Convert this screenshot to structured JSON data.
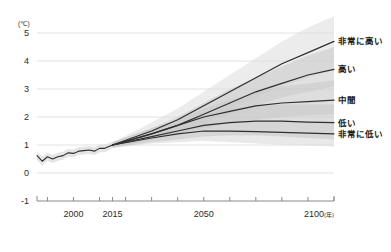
{
  "chart_data": {
    "type": "line",
    "title": "",
    "subtitle": "",
    "xlabel": "年",
    "ylabel": "(℃)",
    "unit": "(℃)",
    "xlim": [
      1986,
      2100
    ],
    "ylim": [
      -1,
      5
    ],
    "grid": true,
    "legend_position": "right",
    "y_ticks": [
      "5",
      "4",
      "3",
      "2",
      "1",
      "0",
      "-1"
    ],
    "y_tick_values": [
      5,
      4,
      3,
      2,
      1,
      0,
      -1
    ],
    "x_ticks": [
      "2000",
      "2015",
      "2050",
      "2100"
    ],
    "x_tick_values": [
      2000,
      2015,
      2050,
      2100
    ],
    "x_minor_ticks": [
      1990,
      2000,
      2010,
      2015,
      2020,
      2030,
      2040,
      2050,
      2060,
      2070,
      2080,
      2090,
      2100
    ],
    "x_suffix": "(年)",
    "colors": {
      "line": "#2f2f2f",
      "band": "#c9c9c9",
      "band_light": "#dcdcdc",
      "grid": "#e2e2e2",
      "axis": "#8a8a8a",
      "text": "#2b2b2b",
      "background": "#ffffff"
    },
    "series": [
      {
        "name": "非常に高い",
        "label": "非常に高い",
        "label_y_value": 4.7,
        "x": [
          2015,
          2030,
          2040,
          2050,
          2060,
          2070,
          2080,
          2090,
          2100
        ],
        "values": [
          1.0,
          1.5,
          1.9,
          2.4,
          2.9,
          3.4,
          3.9,
          4.3,
          4.7
        ],
        "band_upper": [
          1.1,
          1.8,
          2.3,
          2.9,
          3.5,
          4.1,
          4.7,
          5.2,
          5.6
        ],
        "band_lower": [
          0.9,
          1.3,
          1.6,
          1.9,
          2.3,
          2.7,
          3.1,
          3.4,
          3.7
        ]
      },
      {
        "name": "高い",
        "label": "高い",
        "label_y_value": 3.7,
        "x": [
          2015,
          2030,
          2040,
          2050,
          2060,
          2070,
          2080,
          2090,
          2100
        ],
        "values": [
          1.0,
          1.4,
          1.7,
          2.1,
          2.5,
          2.9,
          3.2,
          3.5,
          3.7
        ],
        "band_upper": [
          1.1,
          1.6,
          2.0,
          2.5,
          3.0,
          3.4,
          3.8,
          4.2,
          4.5
        ],
        "band_lower": [
          0.9,
          1.2,
          1.5,
          1.8,
          2.1,
          2.4,
          2.7,
          2.9,
          3.1
        ]
      },
      {
        "name": "中間",
        "label": "中間",
        "label_y_value": 2.6,
        "x": [
          2015,
          2030,
          2040,
          2050,
          2060,
          2070,
          2080,
          2090,
          2100
        ],
        "values": [
          1.0,
          1.4,
          1.7,
          2.0,
          2.2,
          2.4,
          2.5,
          2.55,
          2.6
        ],
        "band_upper": [
          1.1,
          1.6,
          1.9,
          2.3,
          2.6,
          2.9,
          3.1,
          3.2,
          3.3
        ],
        "band_lower": [
          0.9,
          1.2,
          1.4,
          1.6,
          1.8,
          1.9,
          2.0,
          2.05,
          2.1
        ]
      },
      {
        "name": "低い",
        "label": "低い",
        "label_y_value": 1.8,
        "x": [
          2015,
          2030,
          2040,
          2050,
          2060,
          2070,
          2080,
          2090,
          2100
        ],
        "values": [
          1.0,
          1.3,
          1.5,
          1.7,
          1.8,
          1.85,
          1.85,
          1.82,
          1.8
        ],
        "band_upper": [
          1.1,
          1.5,
          1.8,
          2.1,
          2.3,
          2.4,
          2.45,
          2.45,
          2.45
        ],
        "band_lower": [
          0.9,
          1.1,
          1.2,
          1.3,
          1.35,
          1.35,
          1.3,
          1.25,
          1.2
        ]
      },
      {
        "name": "非常に低い",
        "label": "非常に低い",
        "label_y_value": 1.4,
        "x": [
          2015,
          2030,
          2040,
          2050,
          2060,
          2070,
          2080,
          2090,
          2100
        ],
        "values": [
          1.0,
          1.25,
          1.4,
          1.5,
          1.5,
          1.48,
          1.45,
          1.42,
          1.4
        ],
        "band_upper": [
          1.1,
          1.45,
          1.65,
          1.8,
          1.85,
          1.85,
          1.85,
          1.82,
          1.8
        ],
        "band_lower": [
          0.9,
          1.05,
          1.1,
          1.15,
          1.1,
          1.05,
          1.0,
          0.98,
          0.95
        ]
      }
    ],
    "historical": {
      "name": "観測値",
      "x": [
        1986,
        1988,
        1990,
        1992,
        1994,
        1996,
        1998,
        2000,
        2002,
        2004,
        2006,
        2008,
        2010,
        2012,
        2015
      ],
      "values": [
        0.62,
        0.42,
        0.58,
        0.5,
        0.58,
        0.62,
        0.72,
        0.7,
        0.78,
        0.8,
        0.82,
        0.78,
        0.88,
        0.88,
        1.0
      ],
      "band_upper": [
        0.78,
        0.58,
        0.72,
        0.64,
        0.72,
        0.76,
        0.86,
        0.84,
        0.92,
        0.94,
        0.96,
        0.92,
        1.02,
        1.02,
        1.12
      ],
      "band_lower": [
        0.46,
        0.26,
        0.44,
        0.36,
        0.44,
        0.48,
        0.58,
        0.56,
        0.64,
        0.66,
        0.68,
        0.64,
        0.74,
        0.74,
        0.88
      ]
    }
  }
}
